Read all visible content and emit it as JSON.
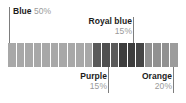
{
  "chart_data": {
    "type": "bar",
    "title": "",
    "subtitle": "",
    "xlabel": "",
    "ylabel": "",
    "orientation": "horizontal",
    "stacked": true,
    "normalized_percent": true,
    "grid": false,
    "legend_position": "callout-labels",
    "total_units": 20,
    "unit_value_percent": 5,
    "categories": [
      "Blue",
      "Purple",
      "Royal blue",
      "Orange"
    ],
    "values": [
      50,
      15,
      15,
      20
    ],
    "units": [
      10,
      3,
      3,
      4
    ],
    "series": [
      {
        "name": "Share",
        "categories": [
          "Blue",
          "Purple",
          "Royal blue",
          "Orange"
        ],
        "values": [
          50,
          15,
          15,
          20
        ]
      }
    ],
    "segments": [
      {
        "name": "Blue",
        "percent": 50,
        "percent_label": "50%",
        "units": 10,
        "color": "#a8a8a8",
        "start_unit": 0,
        "end_unit": 10
      },
      {
        "name": "Purple",
        "percent": 15,
        "percent_label": "15%",
        "units": 3,
        "color": "#5a5a5a",
        "start_unit": 10,
        "end_unit": 13
      },
      {
        "name": "Royal blue",
        "percent": 15,
        "percent_label": "15%",
        "units": 3,
        "color": "#3d3d3d",
        "start_unit": 13,
        "end_unit": 16
      },
      {
        "name": "Orange",
        "percent": 20,
        "percent_label": "20%",
        "units": 4,
        "color": "#919191",
        "start_unit": 16,
        "end_unit": 20
      }
    ],
    "cells": [
      {
        "index": 0,
        "category": "Blue",
        "color": "#a8a8a8"
      },
      {
        "index": 1,
        "category": "Blue",
        "color": "#a8a8a8"
      },
      {
        "index": 2,
        "category": "Blue",
        "color": "#a8a8a8"
      },
      {
        "index": 3,
        "category": "Blue",
        "color": "#a8a8a8"
      },
      {
        "index": 4,
        "category": "Blue",
        "color": "#a8a8a8"
      },
      {
        "index": 5,
        "category": "Blue",
        "color": "#a8a8a8"
      },
      {
        "index": 6,
        "category": "Blue",
        "color": "#a8a8a8"
      },
      {
        "index": 7,
        "category": "Blue",
        "color": "#a8a8a8"
      },
      {
        "index": 8,
        "category": "Blue",
        "color": "#a8a8a8"
      },
      {
        "index": 9,
        "category": "Blue",
        "color": "#a8a8a8"
      },
      {
        "index": 10,
        "category": "Purple",
        "color": "#5a5a5a"
      },
      {
        "index": 11,
        "category": "Purple",
        "color": "#4f4f4f"
      },
      {
        "index": 12,
        "category": "Purple",
        "color": "#5a5a5a"
      },
      {
        "index": 13,
        "category": "Royal blue",
        "color": "#3d3d3d"
      },
      {
        "index": 14,
        "category": "Royal blue",
        "color": "#3d3d3d"
      },
      {
        "index": 15,
        "category": "Royal blue",
        "color": "#454545"
      },
      {
        "index": 16,
        "category": "Orange",
        "color": "#919191"
      },
      {
        "index": 17,
        "category": "Orange",
        "color": "#919191"
      },
      {
        "index": 18,
        "category": "Orange",
        "color": "#919191"
      },
      {
        "index": 19,
        "category": "Orange",
        "color": "#9c9c9c"
      }
    ]
  },
  "callouts": {
    "blue": {
      "category": "Blue",
      "percent": "50%"
    },
    "royal_blue": {
      "category": "Royal blue",
      "percent": "15%"
    },
    "purple": {
      "category": "Purple",
      "percent": "15%"
    },
    "orange": {
      "category": "Orange",
      "percent": "20%"
    }
  },
  "style": {
    "background": "#ffffff",
    "category_text_color": "#1c1c1c",
    "percent_text_color": "#9a9a9a",
    "leader_line_color": "#7d7d7d"
  }
}
